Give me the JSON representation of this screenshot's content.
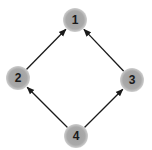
{
  "diagram": {
    "type": "directed-graph",
    "colors": {
      "node_fill": "#a9a9a9",
      "node_edge_glow": "#c8c8c8",
      "edge": "#1a1a1a",
      "label": "#1a1a1a",
      "background": "#ffffff"
    },
    "nodes": [
      {
        "id": "1",
        "label": "1",
        "cx": 75,
        "cy": 20
      },
      {
        "id": "2",
        "label": "2",
        "cx": 18,
        "cy": 78
      },
      {
        "id": "3",
        "label": "3",
        "cx": 132,
        "cy": 80
      },
      {
        "id": "4",
        "label": "4",
        "cx": 76,
        "cy": 136
      }
    ],
    "edges": [
      {
        "from": "2",
        "to": "1"
      },
      {
        "from": "3",
        "to": "1"
      },
      {
        "from": "4",
        "to": "2"
      },
      {
        "from": "4",
        "to": "3"
      }
    ]
  }
}
